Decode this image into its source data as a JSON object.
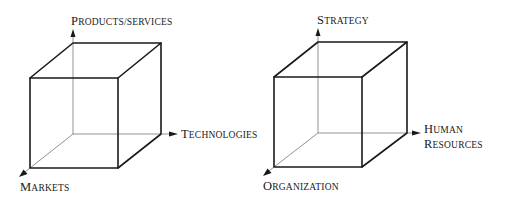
{
  "diagrams": [
    {
      "name": "business-cube",
      "axes": {
        "vertical": {
          "label_cap": "P",
          "label_rest": "RODUCTS/SERVICES",
          "full": "Products/services"
        },
        "horizontal": {
          "label_cap": "T",
          "label_rest": "ECHNOLOGIES",
          "full": "Technologies"
        },
        "depth": {
          "label_cap": "M",
          "label_rest": "ARKETS",
          "full": "Markets"
        }
      }
    },
    {
      "name": "organization-cube",
      "axes": {
        "vertical": {
          "label_cap": "S",
          "label_rest": "TRATEGY",
          "full": "Strategy"
        },
        "horizontal": {
          "line1_cap": "H",
          "line1_rest": "UMAN",
          "line2_cap": "R",
          "line2_rest": "ESOURCES",
          "full": "Human Resources"
        },
        "depth": {
          "label_cap": "O",
          "label_rest": "RGANIZATION",
          "full": "Organization"
        }
      }
    }
  ],
  "colors": {
    "line": "#1a1a1a",
    "background": "#ffffff"
  }
}
